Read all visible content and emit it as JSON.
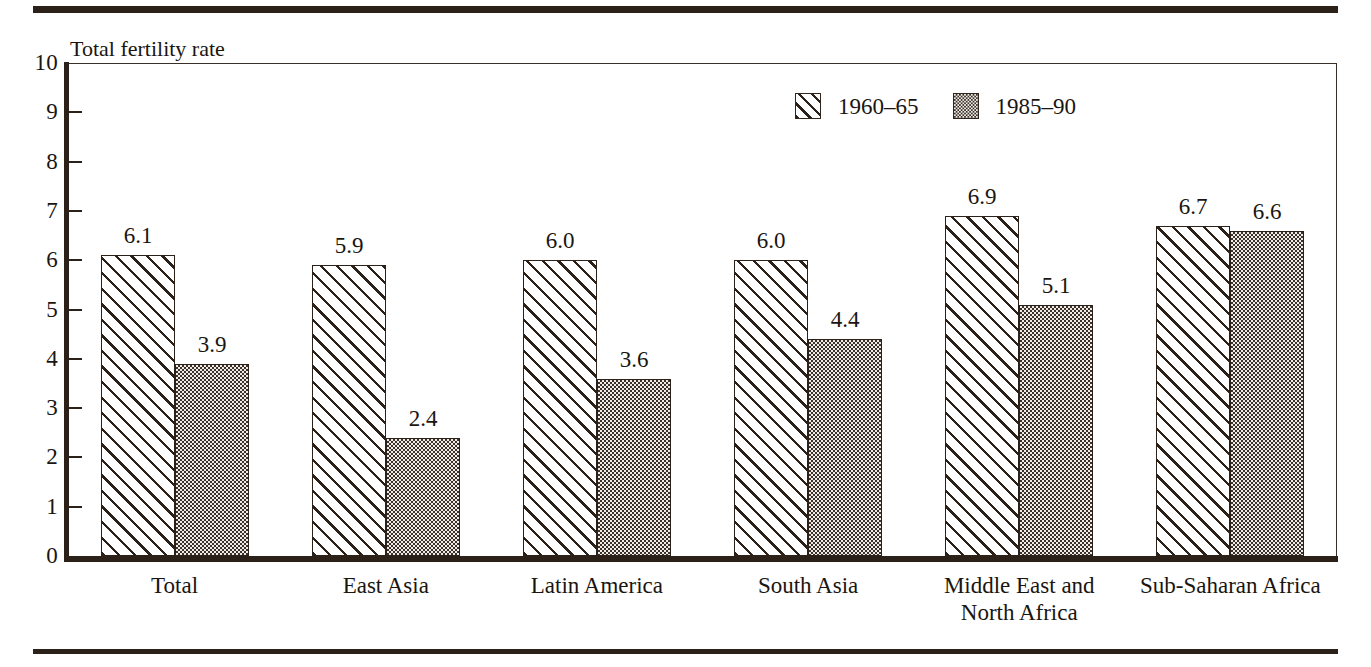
{
  "figure": {
    "axis_title": "Total fertility rate"
  },
  "chart_data": {
    "type": "bar",
    "title": "",
    "xlabel": "",
    "ylabel": "Total fertility rate",
    "ylim": [
      0,
      10
    ],
    "yticks": [
      "10",
      "9",
      "8",
      "7",
      "6",
      "5",
      "4",
      "3",
      "2",
      "1",
      "0"
    ],
    "grid": false,
    "legend_position": "top-center-right",
    "categories": [
      "Total",
      "East Asia",
      "Latin America",
      "South Asia",
      "Middle East and\nNorth Africa",
      "Sub-Saharan Africa"
    ],
    "series": [
      {
        "name": "1960–65",
        "fill": "diagonal-hatch",
        "values": [
          6.1,
          5.9,
          6.0,
          6.0,
          6.9,
          6.7
        ],
        "labels": [
          "6.1",
          "5.9",
          "6.0",
          "6.0",
          "6.9",
          "6.7"
        ]
      },
      {
        "name": "1985–90",
        "fill": "stipple-dots",
        "values": [
          3.9,
          2.4,
          3.6,
          4.4,
          5.1,
          6.6
        ],
        "labels": [
          "3.9",
          "2.4",
          "3.6",
          "4.4",
          "5.1",
          "6.6"
        ]
      }
    ]
  },
  "colors": {
    "ink": "#2b2119",
    "background": "#ffffff",
    "dot_fill": "#9e978e"
  }
}
